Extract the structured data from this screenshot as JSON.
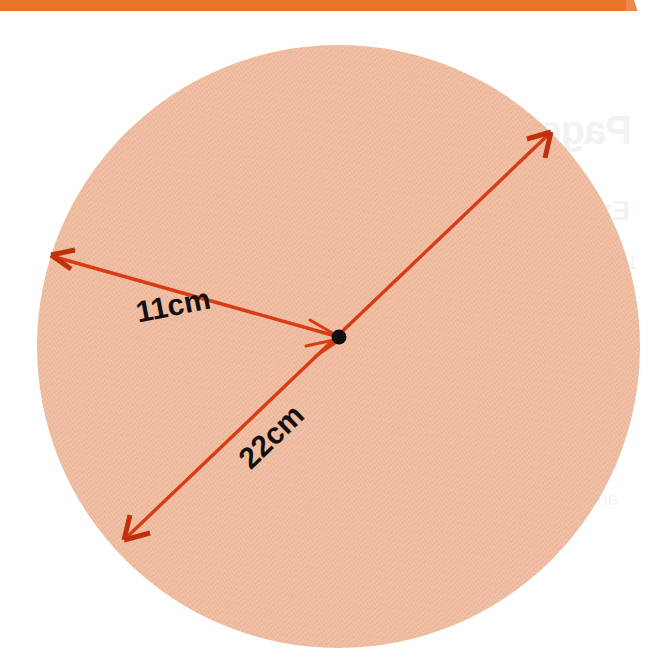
{
  "page": {
    "background_color": "#ffffff",
    "width": 656,
    "height": 665,
    "top_bar_color": "#e8742a"
  },
  "figure": {
    "kind": "geometry-diagram",
    "shape": "circle",
    "fill_color": "#eebb9e",
    "line_color": "#d93b14",
    "center_dot_color": "#111111",
    "center": {
      "x": 339,
      "y": 337
    },
    "radius_px": 302,
    "labels": {
      "radius": "11cm",
      "diameter": "22cm"
    },
    "measurements": [
      {
        "name": "radius",
        "value": 11,
        "unit": "cm",
        "label": "11cm"
      },
      {
        "name": "diameter",
        "value": 22,
        "unit": "cm",
        "label": "22cm"
      }
    ],
    "arrows": [
      {
        "name": "radius-arrow",
        "from": {
          "x": 339,
          "y": 337
        },
        "to": {
          "x": 52,
          "y": 255
        },
        "head": "to"
      },
      {
        "name": "diameter-arrow",
        "from": {
          "x": 550,
          "y": 133
        },
        "to": {
          "x": 126,
          "y": 538
        },
        "head": "both"
      }
    ]
  },
  "ghost_text": {
    "description": "faint bleed-through text from the reverse side of the worksheet page",
    "title": "Page 12",
    "subtitle": "Exercise",
    "lines": [
      "1  Calculate the radius of the",
      "circle shown below. Leave",
      "your answer in terms of pi.",
      "2  Find the area of a circle",
      "with a diameter of 22cm.",
      "Give your answer to 1 d.p.",
      "and state the units used."
    ]
  }
}
